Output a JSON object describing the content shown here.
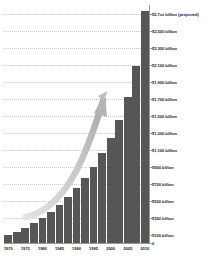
{
  "chart_data": {
    "type": "bar",
    "title": "",
    "subtitle": "",
    "xlabel": "",
    "ylabel": "",
    "grid": true,
    "legend": false,
    "ylim": [
      0,
      2800
    ],
    "y_tick_labels": [
      "$2,7xx billion (projected)",
      "$2,500 billion",
      "$2,300 billion",
      "$2,100 billion",
      "$1,900 billion",
      "$1,700 billion",
      "$1,500 billion",
      "$1,300 billion",
      "$1,100 billion",
      "$900 billion",
      "$700 billion",
      "$500 billion",
      "$300 billion",
      "$100 billion",
      "0"
    ],
    "y_tick_values": [
      2700,
      2500,
      2300,
      2100,
      1900,
      1700,
      1500,
      1300,
      1100,
      900,
      700,
      500,
      300,
      100,
      0
    ],
    "x_tick_labels": [
      "1970",
      "1975",
      "1980",
      "1985",
      "1990",
      "1995",
      "2000",
      "2005",
      "2010"
    ],
    "categories": [
      "1970",
      "1972",
      "1975",
      "1977",
      "1980",
      "1982",
      "1985",
      "1987",
      "1990",
      "1992",
      "1995",
      "1997",
      "2000",
      "2002",
      "2005",
      "2007",
      "2010"
    ],
    "values": [
      95,
      130,
      180,
      235,
      300,
      370,
      450,
      545,
      650,
      770,
      900,
      1060,
      1240,
      1450,
      1720,
      2080,
      2730
    ],
    "annotations": [
      {
        "name": "growth-trend-arrow",
        "type": "curved-arrow",
        "description": "upward sweeping curved arrow over the bars"
      }
    ],
    "colors": {
      "bar": "#565656",
      "gridline": "#c9c9c9",
      "axis": "#9a9a9a",
      "arrow": "#bdbdbd",
      "text": "#1a1a1a",
      "background": "#ffffff"
    }
  }
}
